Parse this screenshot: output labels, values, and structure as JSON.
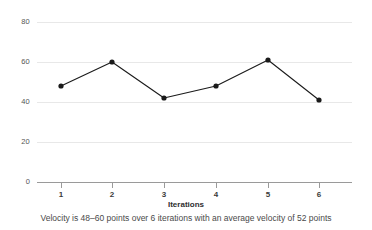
{
  "chart_data": {
    "type": "line",
    "title": "",
    "subtitle": "",
    "xlabel": "Iterations",
    "ylabel": "",
    "caption": "Velocity is 48–60 points over 6 iterations with an average velocity of 52 points",
    "categories": [
      "1",
      "2",
      "3",
      "4",
      "5",
      "6"
    ],
    "x": [
      1,
      2,
      3,
      4,
      5,
      6
    ],
    "values": [
      48,
      60,
      42,
      48,
      61,
      41
    ],
    "series": [
      {
        "name": "Velocity",
        "values": [
          48,
          60,
          42,
          48,
          61,
          41
        ]
      }
    ],
    "ylim": [
      0,
      80
    ],
    "xlim": [
      0.5,
      6.5
    ],
    "y_ticks": [
      0,
      20,
      40,
      60,
      80
    ],
    "y_tick_labels": [
      "0",
      "20",
      "40",
      "60",
      "80"
    ],
    "x_tick_labels": [
      "1",
      "2",
      "3",
      "4",
      "5",
      "6"
    ],
    "grid": true,
    "grid_axis": "y",
    "legend": false,
    "legend_position": "none",
    "marker": "circle",
    "line_color": "#1a1a1a",
    "marker_color": "#1a1a1a",
    "grid_color": "#e8e8e8",
    "axis_color": "#9a9a9a",
    "background_color": "#ffffff",
    "summary": {
      "min": 41,
      "max": 61,
      "average": 52,
      "iterations": 6
    }
  }
}
